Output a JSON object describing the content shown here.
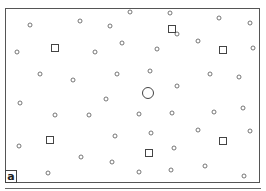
{
  "figure": {
    "panel_label": "a",
    "stroke_color": "#555555",
    "background": "#ffffff"
  },
  "markers": {
    "small_circles": [
      [
        30,
        25
      ],
      [
        80,
        21
      ],
      [
        110,
        26
      ],
      [
        130,
        12
      ],
      [
        17,
        52
      ],
      [
        95,
        52
      ],
      [
        122,
        43
      ],
      [
        40,
        74
      ],
      [
        73,
        80
      ],
      [
        117,
        74
      ],
      [
        170,
        13
      ],
      [
        219,
        18
      ],
      [
        250,
        23
      ],
      [
        177,
        34
      ],
      [
        198,
        41
      ],
      [
        157,
        49
      ],
      [
        253,
        48
      ],
      [
        150,
        71
      ],
      [
        210,
        74
      ],
      [
        239,
        77
      ],
      [
        177,
        86
      ],
      [
        20,
        103
      ],
      [
        106,
        99
      ],
      [
        55,
        115
      ],
      [
        89,
        115
      ],
      [
        19,
        146
      ],
      [
        115,
        136
      ],
      [
        81,
        157
      ],
      [
        112,
        162
      ],
      [
        48,
        173
      ],
      [
        139,
        114
      ],
      [
        172,
        113
      ],
      [
        214,
        112
      ],
      [
        243,
        108
      ],
      [
        151,
        133
      ],
      [
        198,
        130
      ],
      [
        250,
        131
      ],
      [
        174,
        148
      ],
      [
        205,
        166
      ],
      [
        139,
        172
      ],
      [
        171,
        170
      ],
      [
        244,
        176
      ]
    ],
    "squares": [
      [
        55,
        48
      ],
      [
        172,
        29
      ],
      [
        223,
        50
      ],
      [
        50,
        140
      ],
      [
        149,
        153
      ],
      [
        223,
        141
      ]
    ],
    "large_circle": [
      148,
      93
    ]
  }
}
